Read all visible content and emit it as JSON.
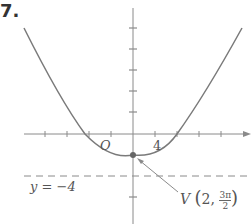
{
  "problem_number": "7.",
  "labels": {
    "origin": "O",
    "x_tick_label": "4",
    "directrix": "y = −4",
    "vertex_prefix": "V",
    "vertex_r": "2,",
    "vertex_theta_num": "3π",
    "vertex_theta_den": "2"
  },
  "colors": {
    "curve": "#7a7a7a",
    "axis": "#8a8a8a",
    "text": "#555555"
  }
}
